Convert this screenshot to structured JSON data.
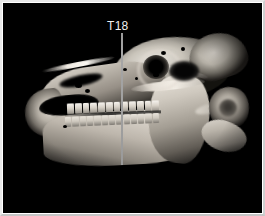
{
  "figure": {
    "title": "T18",
    "modality": "3D CT volume rendering",
    "view": "lateral",
    "background_color": "#000000",
    "frame_color": "#e8e8e8",
    "canvas": {
      "width": 259,
      "height": 210
    }
  },
  "annotations": {
    "slice_marker": {
      "label": "T18",
      "label_color": "#f0f0f0",
      "line_color": "#9a9a9a",
      "line_x": 118,
      "line_top": 30,
      "line_bottom": 162,
      "label_x": 104,
      "label_y": 17
    }
  },
  "anatomy": {
    "regions": [
      {
        "name": "cranium"
      },
      {
        "name": "occipital-crest"
      },
      {
        "name": "maxilla"
      },
      {
        "name": "nasal-aperture"
      },
      {
        "name": "rostrum"
      },
      {
        "name": "mandible"
      },
      {
        "name": "mandibular-ramus"
      },
      {
        "name": "orbit"
      },
      {
        "name": "temporal-fossa"
      },
      {
        "name": "zygomatic-arch"
      },
      {
        "name": "atlas-vertebra"
      },
      {
        "name": "axis-vertebra"
      },
      {
        "name": "maxillary-cheek-teeth"
      },
      {
        "name": "mandibular-cheek-teeth"
      }
    ],
    "teeth_upper_count": 12,
    "teeth_lower_count": 13
  }
}
